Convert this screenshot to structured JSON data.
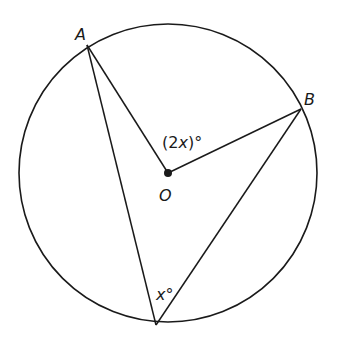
{
  "diagram": {
    "points": {
      "A": "A",
      "B": "B",
      "O": "O"
    },
    "angles": {
      "central_label_open": "(2",
      "central_label_var": "x",
      "central_label_close": ")°",
      "inscribed_label_var": "x",
      "inscribed_label_deg": "°"
    },
    "colors": {
      "stroke": "#1a1a1a",
      "background": "#ffffff"
    }
  }
}
